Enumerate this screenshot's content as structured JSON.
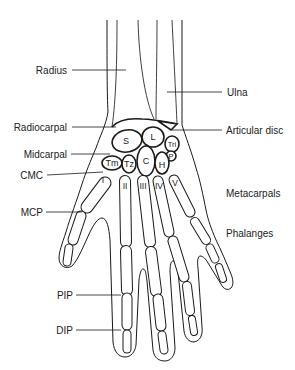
{
  "labels": {
    "radius": "Radius",
    "ulna": "Ulna",
    "radiocarpal": "Radiocarpal",
    "articular_disc": "Articular disc",
    "midcarpal": "Midcarpal",
    "cmc": "CMC",
    "mcp": "MCP",
    "metacarpals": "Metacarpals",
    "phalanges": "Phalanges",
    "pip": "PIP",
    "dip": "DIP"
  },
  "carpals": {
    "scaphoid": "S",
    "lunate": "L",
    "triquetrum": "Tri",
    "pisiform": "P",
    "trapezium": "Tm",
    "trapezoid": "Tz",
    "capitate": "C",
    "hamate": "H"
  },
  "metacarpal_numerals": [
    "I",
    "II",
    "III",
    "IV",
    "V"
  ],
  "colors": {
    "line": "#1a1a1a",
    "text": "#222222",
    "background": "#ffffff"
  }
}
